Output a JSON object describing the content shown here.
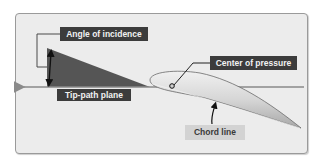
{
  "diagram": {
    "labels": {
      "angle_of_incidence": "Angle of incidence",
      "tip_path_plane": "Tip-path plane",
      "center_of_pressure": "Center of pressure",
      "chord_line": "Chord line"
    },
    "colors": {
      "background": "#ececec",
      "frame_border": "#9a9a9a",
      "wedge": "#555555",
      "dark_label_bg": "#3c3c3c",
      "dark_label_text": "#f2f2f2",
      "light_label_bg": "#d3d3d3",
      "light_label_text": "#3a3a3a",
      "tip_path_line": "#8a8a8a",
      "airfoil_fill": "#d8d8d8",
      "airfoil_stroke": "#6a6a6a"
    },
    "elements": [
      {
        "name": "tip-path-plane",
        "type": "arrow-line",
        "direction": "left"
      },
      {
        "name": "angle-wedge",
        "type": "filled-triangle"
      },
      {
        "name": "angle-arrow",
        "type": "double-headed-arrow"
      },
      {
        "name": "airfoil",
        "type": "blade-cross-section"
      },
      {
        "name": "center-of-pressure-point",
        "type": "point"
      },
      {
        "name": "chord-line-pointer",
        "type": "arrow"
      }
    ]
  }
}
